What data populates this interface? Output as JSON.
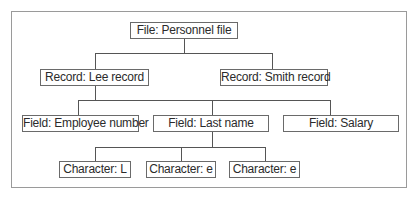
{
  "diagram": {
    "type": "hierarchy",
    "root": {
      "label": "File: Personnel file",
      "children": [
        {
          "label": "Record: Lee record",
          "children": [
            {
              "label": "Field: Employee number"
            },
            {
              "label": "Field: Last name",
              "children": [
                {
                  "label": "Character: L"
                },
                {
                  "label": "Character: e"
                },
                {
                  "label": "Character: e"
                }
              ]
            },
            {
              "label": "Field: Salary"
            }
          ]
        },
        {
          "label": "Record: Smith record"
        }
      ]
    },
    "nodes": {
      "file": "File: Personnel file",
      "record_lee": "Record: Lee record",
      "record_smith": "Record: Smith record",
      "field_employee": "Field: Employee number",
      "field_lastname": "Field: Last name",
      "field_salary": "Field: Salary",
      "char_1": "Character: L",
      "char_2": "Character: e",
      "char_3": "Character: e"
    },
    "colors": {
      "border": "#6a6a6a",
      "line": "#555555",
      "frame": "#9a9a9a",
      "text": "#2b2b2b"
    }
  }
}
